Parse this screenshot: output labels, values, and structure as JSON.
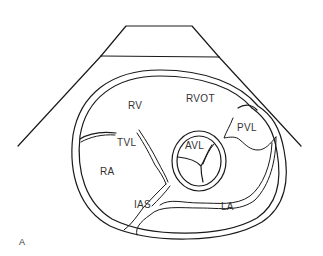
{
  "figure": {
    "panel_label": "A",
    "labels": {
      "rv": "RV",
      "rvot": "RVOT",
      "pvl": "PVL",
      "tvl": "TVL",
      "avl": "AVL",
      "ra": "RA",
      "ias": "IAS",
      "la": "LA"
    }
  },
  "colors": {
    "stroke": "#1a1a1a",
    "text": "#333333",
    "background": "#ffffff"
  }
}
